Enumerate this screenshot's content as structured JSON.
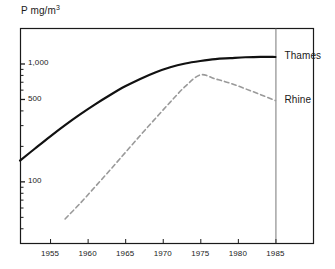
{
  "chart_data": {
    "type": "line",
    "title": "",
    "xlabel": "",
    "ylabel": "P mg/m³",
    "yscale": "log",
    "ylim": [
      30,
      2000
    ],
    "xlim": [
      1951,
      1990
    ],
    "grid": false,
    "legend_position": "right-of-plot",
    "y_ticks_labeled": [
      {
        "value": 100,
        "label": "100"
      },
      {
        "value": 500,
        "label": "500"
      },
      {
        "value": 1000,
        "label": "1,000"
      }
    ],
    "y_ticks_minor": [
      40,
      50,
      60,
      70,
      80,
      90,
      200,
      300,
      400,
      600,
      700,
      800,
      900,
      2000
    ],
    "x_ticks": [
      {
        "value": 1955,
        "label": "1955"
      },
      {
        "value": 1960,
        "label": "1960"
      },
      {
        "value": 1965,
        "label": "1965"
      },
      {
        "value": 1970,
        "label": "1970"
      },
      {
        "value": 1975,
        "label": "1975"
      },
      {
        "value": 1980,
        "label": "1980"
      },
      {
        "value": 1985,
        "label": "1985"
      }
    ],
    "annotations": [
      {
        "name": "end-of-data-marker",
        "type": "vertical-line",
        "x": 1985
      }
    ],
    "series": [
      {
        "name": "Thames",
        "label": "Thames",
        "color": "#111111",
        "style": "solid",
        "width": 2.2,
        "x": [
          1951,
          1953,
          1955,
          1957,
          1959,
          1961,
          1963,
          1965,
          1967,
          1969,
          1971,
          1973,
          1975,
          1977,
          1979,
          1981,
          1983,
          1985
        ],
        "values": [
          150,
          190,
          240,
          300,
          370,
          450,
          540,
          640,
          740,
          840,
          930,
          1000,
          1050,
          1090,
          1110,
          1130,
          1140,
          1135
        ]
      },
      {
        "name": "Rhine",
        "label": "Rhine",
        "color": "#9a9a9a",
        "style": "dashed",
        "width": 1.6,
        "x": [
          1957,
          1959,
          1961,
          1963,
          1965,
          1967,
          1969,
          1971,
          1973,
          1975,
          1977,
          1979,
          1981,
          1983,
          1985
        ],
        "values": [
          48,
          65,
          90,
          125,
          175,
          245,
          340,
          470,
          640,
          800,
          740,
          680,
          610,
          545,
          485
        ]
      }
    ]
  }
}
